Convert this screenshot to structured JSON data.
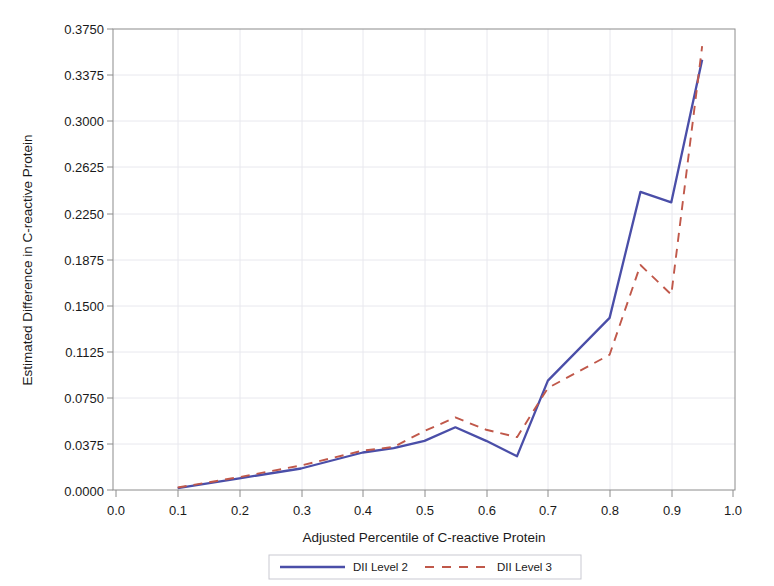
{
  "chart_data": {
    "type": "line",
    "title": "",
    "xlabel": "Adjusted Percentile of C-reactive Protein",
    "ylabel": "Estimated Difference in C-reactive Protein",
    "xlim": [
      0.0,
      1.0
    ],
    "ylim": [
      0.0,
      0.375
    ],
    "xticks": [
      "0.0",
      "0.1",
      "0.2",
      "0.3",
      "0.4",
      "0.5",
      "0.6",
      "0.7",
      "0.8",
      "0.9",
      "1.0"
    ],
    "xtick_values": [
      0.0,
      0.1,
      0.2,
      0.3,
      0.4,
      0.5,
      0.6,
      0.7,
      0.8,
      0.9,
      1.0
    ],
    "yticks": [
      "0.0000",
      "0.0375",
      "0.0750",
      "0.1125",
      "0.1500",
      "0.1875",
      "0.2250",
      "0.2625",
      "0.3000",
      "0.3375",
      "0.3750"
    ],
    "ytick_values": [
      0.0,
      0.0375,
      0.075,
      0.1125,
      0.15,
      0.1875,
      0.225,
      0.2625,
      0.3,
      0.3375,
      0.375
    ],
    "grid": true,
    "legend_position": "bottom",
    "series": [
      {
        "name": "DII Level 2",
        "style": "solid",
        "color": "#4a4ea8",
        "x": [
          0.1,
          0.2,
          0.3,
          0.4,
          0.45,
          0.5,
          0.55,
          0.6,
          0.65,
          0.7,
          0.8,
          0.85,
          0.9,
          0.95
        ],
        "values": [
          0.0015,
          0.0095,
          0.0175,
          0.0305,
          0.034,
          0.04,
          0.051,
          0.04,
          0.0275,
          0.089,
          0.14,
          0.2425,
          0.234,
          0.35
        ]
      },
      {
        "name": "DII Level 3",
        "style": "dashed",
        "color": "#c0584a",
        "x": [
          0.1,
          0.2,
          0.3,
          0.4,
          0.45,
          0.5,
          0.55,
          0.6,
          0.65,
          0.7,
          0.8,
          0.85,
          0.9,
          0.95
        ],
        "values": [
          0.002,
          0.0105,
          0.02,
          0.032,
          0.035,
          0.048,
          0.059,
          0.049,
          0.043,
          0.083,
          0.11,
          0.183,
          0.159,
          0.361
        ]
      }
    ]
  },
  "legend": {
    "entries": [
      {
        "label": "DII Level 2"
      },
      {
        "label": "DII Level 3"
      }
    ]
  },
  "colors": {
    "series_1": "#4a4ea8",
    "series_2": "#c0584a",
    "frame": "#8c8c8c",
    "grid": "#e8e8ee",
    "text": "#1a1a1a",
    "background": "#ffffff"
  }
}
